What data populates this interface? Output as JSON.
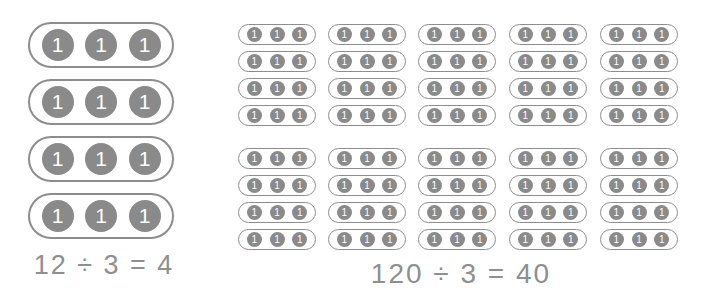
{
  "canvas": {
    "width": 706,
    "height": 301,
    "background_color": "#ffffff"
  },
  "style": {
    "counter_fill_color": "#8a8a8a",
    "counter_label_color": "#ffffff",
    "group_border_color": "#8d8d8d",
    "equation_text_color": "#8f8f8f"
  },
  "left_diagram": {
    "name": "twelve-divided-by-three",
    "counter_label": "1",
    "group_count": 4,
    "counters_per_group": 3,
    "total_counters": 12,
    "equation": "12 ÷ 3 = 4",
    "dividend": 12,
    "divisor": 3,
    "quotient": 4
  },
  "right_diagram": {
    "name": "one-hundred-twenty-divided-by-three",
    "counter_label": "1",
    "block_count": 2,
    "columns_per_block": 5,
    "groups_per_column": 4,
    "group_count": 40,
    "counters_per_group": 3,
    "total_counters": 120,
    "equation": "120 ÷ 3 = 40",
    "dividend": 120,
    "divisor": 3,
    "quotient": 40
  }
}
